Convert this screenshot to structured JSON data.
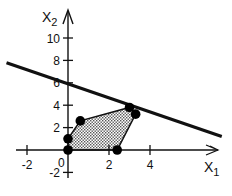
{
  "chart_data": {
    "type": "line",
    "title": "",
    "xlabel": "x1",
    "ylabel": "x2",
    "x_ticks": [
      -2,
      2,
      4
    ],
    "y_ticks": [
      -2,
      2,
      4,
      6,
      8,
      10
    ],
    "origin_label": "0",
    "xlim": [
      -3,
      7.8
    ],
    "ylim": [
      -2.5,
      11.5
    ],
    "grid": false,
    "feasible_region": {
      "shaded": true,
      "vertices": [
        [
          0,
          0
        ],
        [
          0,
          1
        ],
        [
          0.6,
          2.6
        ],
        [
          3,
          3.8
        ],
        [
          3.3,
          3.2
        ],
        [
          2.4,
          0
        ]
      ]
    },
    "points": [
      [
        0,
        0
      ],
      [
        0,
        1
      ],
      [
        0.6,
        2.6
      ],
      [
        3,
        3.8
      ],
      [
        3.3,
        3.2
      ],
      [
        2.4,
        0
      ]
    ],
    "lines": [
      {
        "name": "objective",
        "x": [
          -3.0,
          7.5
        ],
        "y": [
          7.8,
          1.2
        ]
      }
    ]
  },
  "labels": {
    "xlabel_main": "X",
    "xlabel_sub": "1",
    "ylabel_main": "X",
    "ylabel_sub": "2",
    "origin": "0",
    "x_ticks": [
      "-2",
      "2",
      "4"
    ],
    "y_ticks": [
      "10",
      "8",
      "6",
      "4",
      "2",
      "-2"
    ]
  }
}
